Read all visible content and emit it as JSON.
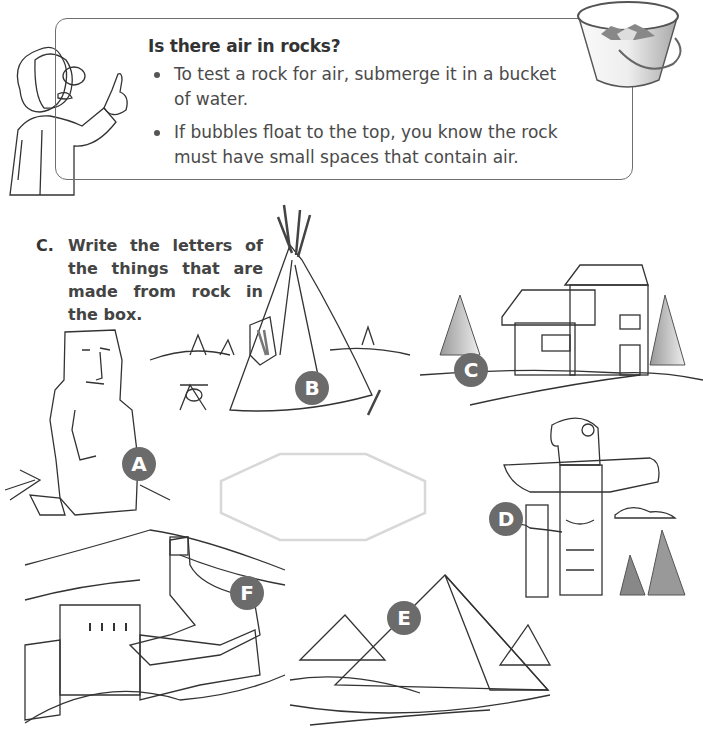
{
  "info_box": {
    "title": "Is there air in rocks?",
    "bullets": [
      "To test a rock for air, submerge it in a bucket of water.",
      "If bubbles float to the top, you know the rock must have small spaces that contain air."
    ],
    "illustrations": [
      "scientist-pointing",
      "bucket-of-water-with-rocks"
    ]
  },
  "question": {
    "letter": "C.",
    "prompt": "Write the letters of the things that are made from rock in the box.",
    "answer_box_value": ""
  },
  "items": [
    {
      "letter": "A",
      "label": "stone statue"
    },
    {
      "letter": "B",
      "label": "teepee"
    },
    {
      "letter": "C",
      "label": "log cabin"
    },
    {
      "letter": "D",
      "label": "totem poles"
    },
    {
      "letter": "E",
      "label": "pyramids"
    },
    {
      "letter": "F",
      "label": "great wall"
    }
  ],
  "colors": {
    "badge": "#6b6b6b",
    "border": "#6e6e6e",
    "answer_box_border": "#d8d8d8"
  }
}
